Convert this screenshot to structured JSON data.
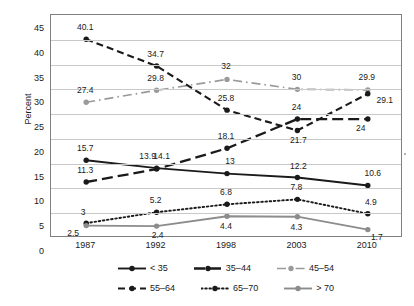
{
  "chart_data": {
    "type": "line",
    "title": "",
    "xlabel": "",
    "ylabel": "Percent",
    "categories": [
      "1987",
      "1992",
      "1998",
      "2003",
      "2010"
    ],
    "ylim": [
      0,
      45
    ],
    "ytick_step": 5,
    "yticks": [
      "45",
      "40",
      "35",
      "30",
      "25",
      "20",
      "15",
      "10",
      "5",
      "0"
    ],
    "grid": true,
    "legend_position": "bottom",
    "series": [
      {
        "name": "< 35",
        "color": "#1a1a1a",
        "style": "solid",
        "marker": "circle",
        "values": [
          15.7,
          14.1,
          13.0,
          12.2,
          10.6
        ],
        "labels": [
          "15.7",
          "14.1",
          "13",
          "12.2",
          "10.6"
        ]
      },
      {
        "name": "35–44",
        "color": "#1a1a1a",
        "style": "longdash",
        "marker": "circle",
        "values": [
          11.3,
          13.9,
          18.1,
          24.0,
          24.0
        ],
        "labels": [
          "11.3",
          "13.9",
          "18.1",
          "24",
          "24"
        ]
      },
      {
        "name": "45–54",
        "color": "#9a9a9a",
        "style": "dashdot",
        "marker": "circle",
        "values": [
          27.4,
          29.8,
          32.0,
          30.0,
          29.9
        ],
        "labels": [
          "27.4",
          "29.8",
          "32",
          "30",
          "29.9"
        ]
      },
      {
        "name": "55–64",
        "color": "#1a1a1a",
        "style": "dashed",
        "marker": "circle",
        "values": [
          40.1,
          34.7,
          25.8,
          21.7,
          29.1
        ],
        "labels": [
          "40.1",
          "34.7",
          "25.8",
          "21.7",
          "29.1"
        ]
      },
      {
        "name": "65–70",
        "color": "#1a1a1a",
        "style": "dotted",
        "marker": "circle",
        "values": [
          3.0,
          5.2,
          6.8,
          7.8,
          4.9
        ],
        "labels": [
          "3",
          "5.2",
          "6.8",
          "7.8",
          "4.9"
        ]
      },
      {
        "name": "> 70",
        "color": "#8c8c8c",
        "style": "solid",
        "marker": "circle",
        "values": [
          2.5,
          2.4,
          4.4,
          4.3,
          1.7
        ],
        "labels": [
          "2.5",
          "2.4",
          "4.4",
          "4.3",
          "1.7"
        ]
      }
    ],
    "label_offsets": [
      [
        [
          0,
          -11
        ],
        [
          6,
          -11
        ],
        [
          4,
          -12
        ],
        [
          2,
          -11
        ],
        [
          6,
          -11
        ]
      ],
      [
        [
          0,
          -11
        ],
        [
          -8,
          -12
        ],
        [
          0,
          -11
        ],
        [
          0,
          -11
        ],
        [
          -6,
          10
        ]
      ],
      [
        [
          0,
          -11
        ],
        [
          0,
          -11
        ],
        [
          0,
          -12
        ],
        [
          0,
          -11
        ],
        [
          0,
          -12
        ]
      ],
      [
        [
          0,
          -11
        ],
        [
          0,
          -11
        ],
        [
          0,
          -11
        ],
        [
          2,
          11
        ],
        [
          18,
          7
        ]
      ],
      [
        [
          -2,
          -10
        ],
        [
          0,
          -11
        ],
        [
          0,
          -11
        ],
        [
          0,
          -11
        ],
        [
          4,
          -11
        ]
      ],
      [
        [
          -12,
          8
        ],
        [
          2,
          10
        ],
        [
          0,
          11
        ],
        [
          0,
          11
        ],
        [
          10,
          8
        ]
      ]
    ]
  }
}
